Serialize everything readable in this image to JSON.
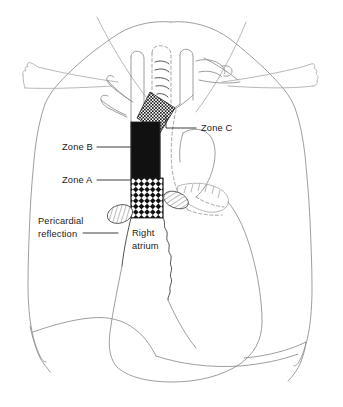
{
  "figure": {
    "background_color": "#ffffff",
    "line_color": "#8c8c8c",
    "text_color": "#1a1a1a"
  },
  "labels": {
    "zone_c": "Zone C",
    "zone_b": "Zone B",
    "zone_a": "Zone A",
    "pericardial_line1": "Pericardial",
    "pericardial_line2": "reflection",
    "right_atrium_line1": "Right",
    "right_atrium_line2": "atrium"
  },
  "zones": [
    {
      "id": "zone-c",
      "label": "Zone C",
      "pattern": "fine-stipple",
      "fill_color": "#ffffff",
      "pattern_color": "#1a1a1a",
      "description": "Upper oblique band at left brachiocephalic vein"
    },
    {
      "id": "zone-b",
      "label": "Zone B",
      "pattern": "solid-black",
      "fill_color": "#111111",
      "pattern_color": "#111111",
      "description": "Middle solid band of superior vena cava"
    },
    {
      "id": "zone-a",
      "label": "Zone A",
      "pattern": "coarse-checkerboard",
      "fill_color": "#ffffff",
      "pattern_color": "#111111",
      "description": "Lower band of superior vena cava above right atrium"
    }
  ],
  "structures": [
    {
      "id": "lung-left",
      "name": "Left lung field",
      "style": "outline"
    },
    {
      "id": "lung-right",
      "name": "Right lung field",
      "style": "outline"
    },
    {
      "id": "clavicle-left",
      "name": "Left clavicle",
      "style": "outline"
    },
    {
      "id": "clavicle-right",
      "name": "Right clavicle",
      "style": "outline"
    },
    {
      "id": "trachea",
      "name": "Trachea",
      "style": "dashed-outline"
    },
    {
      "id": "aortic-arch",
      "name": "Aortic arch",
      "style": "outline"
    },
    {
      "id": "descending-aorta",
      "name": "Descending aorta",
      "style": "dashed-outline"
    },
    {
      "id": "right-atrium",
      "name": "Right atrium",
      "style": "outline"
    },
    {
      "id": "pericardial-reflection",
      "name": "Pericardial reflection",
      "style": "hatched-ellipse"
    },
    {
      "id": "diaphragm",
      "name": "Diaphragm",
      "style": "outline"
    },
    {
      "id": "great-vessels",
      "name": "Great vessels of superior mediastinum",
      "style": "outline"
    }
  ]
}
